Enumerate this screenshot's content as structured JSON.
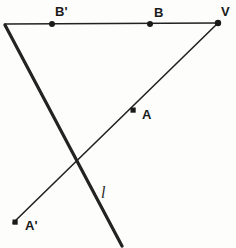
{
  "figure": {
    "type": "geometry-diagram",
    "width": 236,
    "height": 248,
    "background_color": "#fdfdfc",
    "stroke_color": "#222222",
    "labels": {
      "vertex_v": "V",
      "point_b": "B",
      "point_b_prime": "B'",
      "point_a": "A",
      "point_a_prime": "A'",
      "line_l": "l"
    },
    "points": [
      {
        "id": "v",
        "label": "V",
        "x": 218,
        "y": 23,
        "label_x": 221,
        "label_y": 5
      },
      {
        "id": "b",
        "label": "B",
        "x": 150,
        "y": 24,
        "label_x": 154,
        "label_y": 6
      },
      {
        "id": "b_prime",
        "label": "B'",
        "x": 52,
        "y": 24,
        "label_x": 55,
        "label_y": 5
      },
      {
        "id": "a",
        "label": "A",
        "x": 133,
        "y": 110,
        "label_x": 142,
        "label_y": 108
      },
      {
        "id": "a_prime",
        "label": "A'",
        "x": 15,
        "y": 222,
        "label_x": 25,
        "label_y": 219
      }
    ],
    "segments": [
      {
        "id": "ray-horizontal-vb",
        "x1": 5,
        "y1": 24,
        "x2": 218,
        "y2": 23,
        "width": 1.6
      },
      {
        "id": "ray-v-through-a-to-a-prime",
        "x1": 218,
        "y1": 23,
        "x2": 13,
        "y2": 223,
        "width": 1.6
      },
      {
        "id": "line-l",
        "x1": 5,
        "y1": 25,
        "x2": 122,
        "y2": 246,
        "width": 3.2
      }
    ],
    "line_label": {
      "text": "l",
      "x": 101,
      "y": 185
    }
  }
}
